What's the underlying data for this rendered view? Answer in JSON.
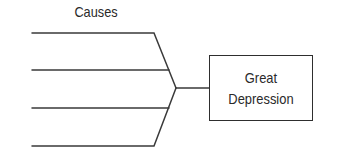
{
  "diagram": {
    "type": "cause-effect (fishbone / converging lines)",
    "title": "Causes",
    "cause_lines": [
      {
        "label": ""
      },
      {
        "label": ""
      },
      {
        "label": ""
      },
      {
        "label": ""
      }
    ],
    "effect": {
      "line1": "Great",
      "line2": "Depression"
    },
    "colors": {
      "line": "#3a3a3a",
      "text": "#2a2a2a",
      "background": "#ffffff"
    }
  }
}
